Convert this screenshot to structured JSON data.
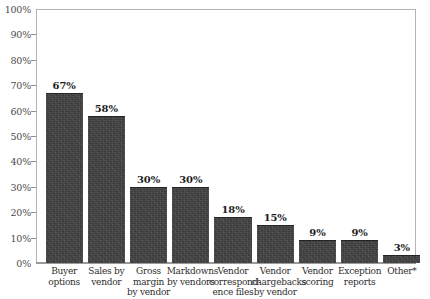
{
  "chart_data": {
    "type": "bar",
    "title": "",
    "subtitle": "",
    "xlabel": "",
    "ylabel": "",
    "ylim": [
      0,
      100
    ],
    "grid": false,
    "legend": "none",
    "y_ticks": [
      "0%",
      "10%",
      "20%",
      "30%",
      "40%",
      "50%",
      "60%",
      "70%",
      "80%",
      "90%",
      "100%"
    ],
    "y_tick_values": [
      0,
      10,
      20,
      30,
      40,
      50,
      60,
      70,
      80,
      90,
      100
    ],
    "categories": [
      "Buyer options",
      "Sales by vendor",
      "Gross margin by vendor",
      "Markdowns by vendors",
      "Vendor correspondence files",
      "Vendor chargebacks by vendor",
      "Vendor scoring",
      "Exception reports",
      "Other*"
    ],
    "category_lines": [
      [
        "Buyer",
        "options"
      ],
      [
        "Sales by",
        "vendor"
      ],
      [
        "Gross",
        "margin",
        "by vendor"
      ],
      [
        "Markdowns",
        "by vendors"
      ],
      [
        "Vendor",
        "correspond-",
        "ence files"
      ],
      [
        "Vendor",
        "chargebacks",
        "by vendor"
      ],
      [
        "Vendor",
        "scoring"
      ],
      [
        "Exception",
        "reports"
      ],
      [
        "Other*"
      ]
    ],
    "values": [
      67,
      58,
      30,
      30,
      18,
      15,
      9,
      9,
      3
    ],
    "value_labels": [
      "67%",
      "58%",
      "30%",
      "30%",
      "18%",
      "15%",
      "9%",
      "9%",
      "3%"
    ],
    "bar_color": "#3b3b3b",
    "axis_color": "#9a9a9a",
    "label_color": "#2e2e2e"
  }
}
